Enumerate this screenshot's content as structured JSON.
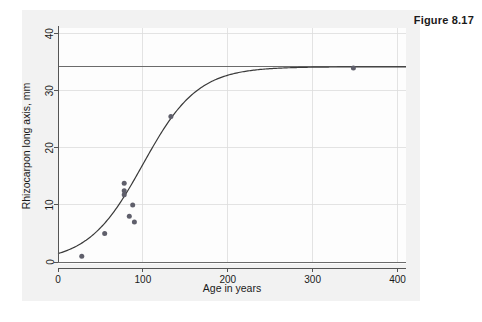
{
  "figure": {
    "label": "Figure 8.17"
  },
  "chart_data": {
    "type": "scatter",
    "title": "",
    "xlabel": "Age in years",
    "ylabel": "Rhizocarpon long axis, mm",
    "xlim": [
      0,
      410
    ],
    "ylim": [
      0,
      41
    ],
    "xticks": [
      0,
      100,
      200,
      300,
      400
    ],
    "xticklabels": [
      "0",
      "100",
      "200",
      "300",
      "400"
    ],
    "yticks": [
      0,
      10,
      20,
      30,
      40
    ],
    "yticklabels": [
      "0",
      "10",
      "20",
      "30",
      "40"
    ],
    "grid": true,
    "legend": false,
    "points": [
      {
        "x": 28,
        "y": 1.0
      },
      {
        "x": 55,
        "y": 5.0
      },
      {
        "x": 78,
        "y": 13.8
      },
      {
        "x": 78,
        "y": 12.5
      },
      {
        "x": 78,
        "y": 11.8
      },
      {
        "x": 84,
        "y": 8.0
      },
      {
        "x": 88,
        "y": 10.0
      },
      {
        "x": 90,
        "y": 7.0
      },
      {
        "x": 133,
        "y": 25.5
      },
      {
        "x": 348,
        "y": 34.0
      }
    ],
    "reference_lines": [
      {
        "name": "asymptote",
        "orientation": "horizontal",
        "y": 34.2
      },
      {
        "name": "baseline",
        "orientation": "horizontal",
        "y": 0.0
      }
    ],
    "fitted_curve": {
      "name": "logistic-growth-fit",
      "model": "logistic",
      "asymptote": 34.2,
      "midpoint": 100,
      "rate": 0.031,
      "x_range": [
        0,
        410
      ]
    },
    "series": [
      {
        "name": "Rhizocarpon measurements",
        "x": [
          28,
          55,
          78,
          78,
          78,
          84,
          88,
          90,
          133,
          348
        ],
        "values": [
          1.0,
          5.0,
          13.8,
          12.5,
          11.8,
          8.0,
          10.0,
          7.0,
          25.5,
          34.0
        ]
      }
    ]
  }
}
